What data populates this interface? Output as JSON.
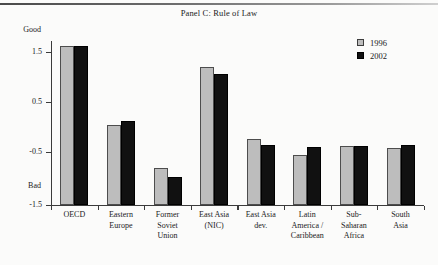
{
  "figure": {
    "title": "Panel C: Rule of Law",
    "good_label": "Good",
    "bad_label": "Bad"
  },
  "legend": {
    "position": "top-right",
    "entries": [
      {
        "label": "1996",
        "color": "#bdbdbd"
      },
      {
        "label": "2002",
        "color": "#111111"
      }
    ]
  },
  "axis": {
    "y_ticks": [
      "1.5",
      "0.5",
      "-0.5",
      "-1.5"
    ],
    "y_tick_values": [
      1.5,
      0.5,
      -0.5,
      -1.5
    ]
  },
  "categories_display": [
    "OECD",
    "Eastern\nEurope",
    "Former\nSoviet\nUnion",
    "East Asia\n(NIC)",
    "East Asia\ndev.",
    "Latin\nAmerica /\nCaribbean",
    "Sub-\nSaharan\nAfrica",
    "South\nAsia"
  ],
  "chart_data": {
    "type": "bar",
    "title": "Panel C: Rule of Law",
    "xlabel": "",
    "ylabel": "",
    "ylim": [
      -1.5,
      2.0
    ],
    "grid": false,
    "legend_position": "top-right",
    "axis_annotations": {
      "top": "Good",
      "bottom": "Bad"
    },
    "categories": [
      "OECD",
      "Eastern Europe",
      "Former Soviet Union",
      "East Asia (NIC)",
      "East Asia dev.",
      "Latin America / Caribbean",
      "Sub-Saharan Africa",
      "South Asia"
    ],
    "series": [
      {
        "name": "1996",
        "color": "#bdbdbd",
        "values": [
          1.62,
          0.07,
          -0.77,
          1.2,
          -0.21,
          -0.52,
          -0.35,
          -0.38
        ]
      },
      {
        "name": "2002",
        "color": "#111111",
        "values": [
          1.62,
          0.15,
          -0.95,
          1.07,
          -0.32,
          -0.37,
          -0.34,
          -0.33
        ]
      }
    ]
  }
}
